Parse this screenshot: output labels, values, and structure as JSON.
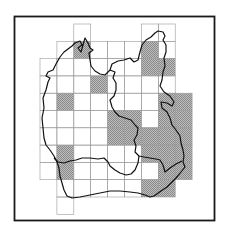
{
  "map": {
    "type": "grid-distribution-map",
    "colors": {
      "frame": "#1a1a1a",
      "grid_line": "#9a9a9a",
      "shaded_cell": "#a8a8a8",
      "boundary": "#111111",
      "background": "#ffffff"
    },
    "grid": {
      "rows": [
        {
          "row": 0,
          "cols": [
            2,
            6,
            7
          ]
        },
        {
          "row": 1,
          "cols": [
            1,
            2,
            3,
            4,
            5,
            6,
            7
          ]
        },
        {
          "row": 2,
          "cols": [
            0,
            1,
            2,
            3,
            4,
            5,
            6,
            7
          ]
        },
        {
          "row": 3,
          "cols": [
            0,
            1,
            2,
            3,
            4,
            5,
            6,
            7
          ]
        },
        {
          "row": 4,
          "cols": [
            0,
            1,
            2,
            3,
            4,
            5,
            6,
            7,
            8
          ]
        },
        {
          "row": 5,
          "cols": [
            0,
            1,
            2,
            3,
            4,
            5,
            6,
            7,
            8
          ]
        },
        {
          "row": 6,
          "cols": [
            0,
            1,
            2,
            3,
            4,
            5,
            6,
            7,
            8
          ]
        },
        {
          "row": 7,
          "cols": [
            0,
            1,
            2,
            3,
            4,
            5,
            6,
            7,
            8
          ]
        },
        {
          "row": 8,
          "cols": [
            0,
            1,
            2,
            3,
            4,
            5,
            6,
            7,
            8
          ]
        },
        {
          "row": 9,
          "cols": [
            1,
            2,
            3,
            4,
            5,
            6,
            7
          ]
        },
        {
          "row": 10,
          "cols": [
            1
          ]
        }
      ],
      "shaded": [
        [
          1,
          2
        ],
        [
          1,
          6
        ],
        [
          2,
          6
        ],
        [
          2,
          7
        ],
        [
          3,
          3
        ],
        [
          4,
          1
        ],
        [
          4,
          7
        ],
        [
          4,
          8
        ],
        [
          5,
          4
        ],
        [
          5,
          5
        ],
        [
          5,
          7
        ],
        [
          5,
          8
        ],
        [
          6,
          4
        ],
        [
          6,
          5
        ],
        [
          6,
          6
        ],
        [
          6,
          7
        ],
        [
          6,
          8
        ],
        [
          7,
          1
        ],
        [
          7,
          6
        ],
        [
          7,
          7
        ],
        [
          7,
          8
        ],
        [
          8,
          1
        ],
        [
          8,
          7
        ],
        [
          8,
          8
        ],
        [
          9,
          6
        ],
        [
          9,
          7
        ]
      ]
    }
  }
}
